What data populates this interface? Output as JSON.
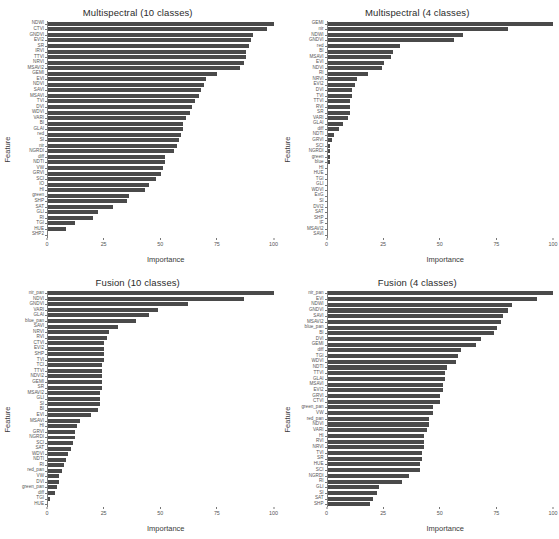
{
  "figure": {
    "background": "#ffffff",
    "bar_color": "#4a4a4a",
    "axis_color": "#7a7a7a",
    "width": 559,
    "height": 539
  },
  "axis_titles": {
    "x": "Importance",
    "y": "Feature"
  },
  "chart_data": [
    {
      "type": "bar",
      "orientation": "horizontal",
      "title": "Multispectral (10 classes)",
      "xlabel": "Importance",
      "ylabel": "Feature",
      "xlim": [
        0,
        100
      ],
      "xticks": [
        0,
        25,
        50,
        75,
        100
      ],
      "grid": false,
      "legend": "none",
      "categories": [
        "NDWI",
        "CTVI",
        "GNDVI",
        "EVI2",
        "SR",
        "IRVI",
        "TTVI",
        "NRVI",
        "MSAVI2",
        "GEMI",
        "EVI",
        "NDVI",
        "SAVI",
        "MSAVI",
        "TVI",
        "DVI",
        "WDVI",
        "VARI",
        "BI",
        "GLAI",
        "red",
        "SI",
        "nir",
        "NGRDI",
        "diff",
        "NDTI",
        "VW",
        "GRVI",
        "SCI",
        "IO",
        "HI",
        "green",
        "SHP",
        "SAT",
        "GLI",
        "RI",
        "TGI",
        "HUE",
        "SHP2"
      ],
      "values": [
        100,
        97,
        91,
        90,
        89,
        88,
        88,
        87,
        85,
        75,
        70,
        69,
        68,
        67,
        65,
        64,
        63,
        61,
        60,
        60,
        59,
        58,
        57,
        56,
        52,
        52,
        51,
        50,
        48,
        45,
        43,
        36,
        35,
        29,
        22,
        20,
        12,
        8,
        0
      ]
    },
    {
      "type": "bar",
      "orientation": "horizontal",
      "title": "Multispectral (4 classes)",
      "xlabel": "Importance",
      "ylabel": "Feature",
      "xlim": [
        0,
        100
      ],
      "xticks": [
        0,
        25,
        50,
        75,
        100
      ],
      "grid": false,
      "legend": "none",
      "categories": [
        "GEMI",
        "nir",
        "NDWI",
        "GNDVI",
        "red",
        "BI",
        "MSAVI",
        "EVI",
        "NDVI",
        "RI",
        "NRVI",
        "EVI2",
        "DVI",
        "TVI",
        "TTVI",
        "RVI",
        "SR",
        "VARI",
        "GLAI",
        "diff",
        "NDTI",
        "GRVI",
        "SCI",
        "NGRDI",
        "green",
        "blue",
        "HI",
        "HUE",
        "TGI",
        "GLI",
        "WDVI",
        "ExG",
        "SI",
        "DVI2",
        "SAT",
        "SHP",
        "IF",
        "MSAVI2",
        "SAVI"
      ],
      "values": [
        100,
        80,
        60,
        56,
        32,
        29,
        28,
        25,
        24,
        18,
        13,
        12,
        11,
        11,
        10,
        10,
        10,
        9,
        7,
        5,
        3,
        2,
        1,
        1,
        1,
        1,
        0,
        0,
        0,
        0,
        0,
        0,
        0,
        0,
        0,
        0,
        0,
        0,
        0
      ]
    },
    {
      "type": "bar",
      "orientation": "horizontal",
      "title": "Fusion (10 classes)",
      "xlabel": "Importance",
      "ylabel": "Feature",
      "xlim": [
        0,
        100
      ],
      "xticks": [
        0,
        25,
        50,
        75,
        100
      ],
      "grid": false,
      "legend": "none",
      "categories": [
        "nir_pan",
        "NDVI",
        "GNDVI",
        "VARI",
        "GLAI",
        "blue_pan",
        "SAVI",
        "NRVI",
        "RVI",
        "CTVI",
        "EVI2",
        "SHP",
        "TVI",
        "TCI",
        "TTVI",
        "NDVI2",
        "GEMI",
        "SR",
        "MSAVI2",
        "GLI",
        "SI",
        "BI",
        "EVI",
        "MSAVI",
        "HI",
        "GRVI",
        "NGRDI",
        "SCI",
        "SAT",
        "WDVI",
        "NDTI",
        "RI",
        "red_pan",
        "VW",
        "DVI",
        "green_pan",
        "diff",
        "TGI",
        "HUE"
      ],
      "values": [
        100,
        87,
        62,
        49,
        45,
        39,
        31,
        27,
        26,
        25,
        25,
        25,
        25,
        24,
        24,
        24,
        24,
        24,
        23,
        23,
        23,
        22,
        19,
        14,
        13,
        12,
        12,
        11,
        10,
        9,
        8,
        7,
        6,
        5,
        5,
        4,
        3,
        1,
        0
      ]
    },
    {
      "type": "bar",
      "orientation": "horizontal",
      "title": "Fusion (4 classes)",
      "xlabel": "Importance",
      "ylabel": "Feature",
      "xlim": [
        0,
        100
      ],
      "xticks": [
        0,
        25,
        50,
        75,
        100
      ],
      "grid": false,
      "legend": "none",
      "categories": [
        "nir_pan",
        "EVI",
        "NDWI",
        "GNDVI",
        "SAVI",
        "MSAVI2",
        "blue_pan",
        "BI",
        "DVI",
        "GEMI",
        "diff",
        "TGI",
        "WDVI",
        "NDTI",
        "TTVI",
        "GLAI",
        "MSAVI",
        "EVI2",
        "GRVI",
        "CTVI",
        "green_pan",
        "VW",
        "red_pan",
        "NDVI",
        "VARI",
        "HI",
        "RVI",
        "NRVI",
        "TVI",
        "SR",
        "HUE",
        "SCI",
        "NGRDI",
        "RI",
        "GLI",
        "SI",
        "SAT",
        "SHP"
      ],
      "values": [
        100,
        93,
        82,
        80,
        78,
        77,
        75,
        74,
        68,
        66,
        59,
        58,
        57,
        53,
        52,
        52,
        51,
        51,
        50,
        50,
        47,
        47,
        45,
        45,
        44,
        43,
        43,
        43,
        42,
        42,
        41,
        41,
        36,
        33,
        23,
        22,
        20,
        19
      ]
    }
  ]
}
